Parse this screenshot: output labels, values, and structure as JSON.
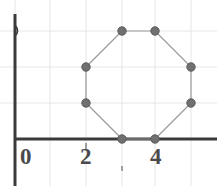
{
  "figure": {
    "width": 217,
    "height": 186,
    "background_color": "#ffffff"
  },
  "axes": {
    "x_axis": {
      "color": "#3b3b3b",
      "y_pixel": 139,
      "x_start_pixel": 15,
      "x_end_pixel": 217,
      "thickness": 3
    },
    "y_axis": {
      "color": "#3b3b3b",
      "x_pixel": 15,
      "y_start_pixel": 14,
      "y_end_pixel": 186,
      "thickness": 3
    },
    "arrow_marker": {
      "name": "y-axis-arrow",
      "x_pixel": 15,
      "y_pixel": 31
    }
  },
  "grid": {
    "color": "#e6e6e8",
    "show": true,
    "spacing_pixels": 36,
    "vertical_lines_x": [
      15,
      50,
      86,
      122,
      155,
      191
    ],
    "horizontal_lines_y": [
      31,
      67,
      103
    ]
  },
  "tick_labels": {
    "x": [
      {
        "text": "0",
        "x_pixel": 20,
        "y_pixel": 145
      },
      {
        "text": "2",
        "x_pixel": 80,
        "y_pixel": 145
      },
      {
        "text": "4",
        "x_pixel": 150,
        "y_pixel": 145
      }
    ],
    "color": "#4a4a4a"
  },
  "minor_ticks": [
    {
      "x_pixel": 86,
      "y_pixel": 143,
      "length": 6
    },
    {
      "x_pixel": 122,
      "y_pixel": 166,
      "length": 5
    }
  ],
  "chart_data": {
    "type": "scatter",
    "title": "",
    "xlabel": "",
    "ylabel": "",
    "grid": true,
    "legend": null,
    "xlim": [
      0,
      6.7
    ],
    "ylim": [
      0,
      4.4
    ],
    "x_tick_values": [
      0,
      2,
      4
    ],
    "y_tick_values": [],
    "shape": "octagon",
    "series": [
      {
        "name": "octagon-vertices",
        "marker": "circle",
        "marker_color": "#707070",
        "marker_edge_color": "#5a5a5a",
        "marker_radius_px": 4.2,
        "line_color": "#9a9a9a",
        "line_width": 1.2,
        "closed": true,
        "x": [
          3,
          4,
          5,
          5,
          4,
          3,
          2,
          2
        ],
        "y": [
          3,
          3,
          2,
          1,
          0,
          0,
          1,
          2
        ],
        "points_pixels": [
          {
            "label": "top-left",
            "x": 122,
            "y": 31
          },
          {
            "label": "top-right",
            "x": 155,
            "y": 31
          },
          {
            "label": "upper-right",
            "x": 191,
            "y": 67
          },
          {
            "label": "lower-right",
            "x": 191,
            "y": 103
          },
          {
            "label": "bottom-right",
            "x": 155,
            "y": 139
          },
          {
            "label": "bottom-left",
            "x": 122,
            "y": 139
          },
          {
            "label": "lower-left",
            "x": 86,
            "y": 103
          },
          {
            "label": "upper-left",
            "x": 86,
            "y": 67
          }
        ]
      }
    ]
  }
}
